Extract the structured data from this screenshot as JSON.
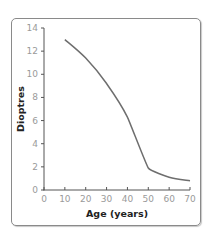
{
  "chart_data": {
    "type": "line",
    "title": "",
    "xlabel": "Age (years)",
    "ylabel": "Dioptres",
    "xlim": [
      0,
      70
    ],
    "ylim": [
      0,
      14
    ],
    "xticks": [
      0,
      10,
      20,
      30,
      40,
      50,
      60,
      70
    ],
    "yticks": [
      0,
      2,
      4,
      6,
      8,
      10,
      12,
      14
    ],
    "grid": false,
    "legend": null,
    "series": [
      {
        "name": "Accommodation amplitude",
        "color": "#6e6e6e",
        "x": [
          10,
          20,
          30,
          40,
          50,
          60,
          70
        ],
        "y": [
          13.0,
          11.4,
          9.2,
          6.3,
          1.9,
          1.1,
          0.8
        ]
      }
    ]
  },
  "axes": {
    "x_title": "Age (years)",
    "y_title": "Dioptres"
  }
}
